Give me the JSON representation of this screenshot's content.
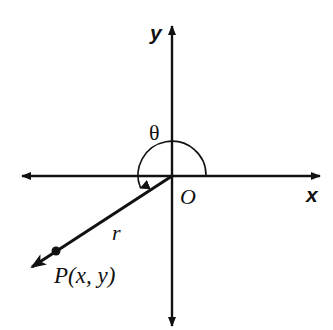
{
  "diagram": {
    "colors": {
      "stroke": "#111111",
      "background": "#ffffff"
    },
    "labels": {
      "y_axis": "y",
      "x_axis": "x",
      "origin": "O",
      "angle": "θ",
      "radius": "r",
      "point": "P(x, y)"
    },
    "geometry": {
      "origin": [
        172,
        176
      ],
      "x_axis": {
        "from": [
          22,
          176
        ],
        "to": [
          320,
          176
        ]
      },
      "y_axis": {
        "from": [
          172,
          326
        ],
        "to": [
          172,
          26
        ]
      },
      "arc_radius": 34,
      "terminal_ray_end": [
        30,
        268
      ],
      "point_p": [
        56,
        251
      ]
    }
  }
}
